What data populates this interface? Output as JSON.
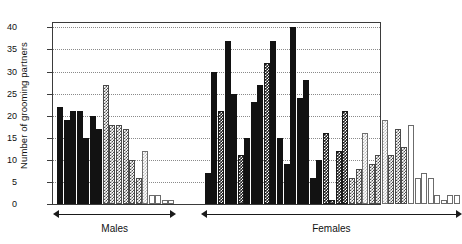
{
  "chart_data": {
    "type": "bar",
    "title": "",
    "xlabel": "",
    "ylabel": "Number of grooming partners",
    "ylim": [
      0,
      41
    ],
    "yticks": [
      0,
      5,
      10,
      15,
      20,
      25,
      30,
      35,
      40
    ],
    "ytick_labels": [
      "0",
      "5",
      "10",
      "15",
      "20",
      "25",
      "30",
      "35",
      "40"
    ],
    "grid": "horizontal-dotted",
    "legend": "none",
    "groups": [
      {
        "name": "Males",
        "label": "Males"
      },
      {
        "name": "Females",
        "label": "Females"
      }
    ],
    "series": [
      {
        "name": "Males",
        "values": [
          22,
          19,
          21,
          21,
          15,
          20,
          17,
          27,
          18,
          18,
          17,
          10,
          6,
          12,
          2,
          2,
          1,
          1
        ],
        "fills": [
          "solid",
          "solid",
          "solid",
          "solid",
          "solid",
          "solid",
          "solid",
          "hatch",
          "hatch",
          "hatch",
          "hatch",
          "hatch",
          "hatch",
          "light",
          "white",
          "white",
          "white",
          "white"
        ]
      },
      {
        "name": "Females",
        "values": [
          7,
          30,
          21,
          37,
          25,
          11,
          15,
          23,
          27,
          32,
          37,
          15,
          9,
          40,
          24,
          28,
          6,
          10,
          16,
          1,
          12,
          21,
          6,
          8,
          16,
          9,
          11,
          19,
          11,
          17,
          13,
          18,
          6,
          7,
          6,
          2,
          1,
          2,
          2
        ],
        "fills": [
          "solid",
          "solid",
          "checker",
          "solid",
          "solid",
          "checker",
          "solid",
          "solid",
          "solid",
          "checker",
          "solid",
          "solid",
          "solid",
          "solid",
          "solid",
          "solid",
          "solid",
          "solid",
          "checker",
          "checker",
          "checker",
          "checker",
          "hatch",
          "hatch",
          "light",
          "hatch",
          "hatch",
          "light",
          "hatch",
          "hatch",
          "hatch",
          "white",
          "white",
          "white",
          "white",
          "white",
          "white",
          "white",
          "white"
        ]
      }
    ]
  },
  "axis": {
    "y_title": "Number of grooming partners"
  }
}
